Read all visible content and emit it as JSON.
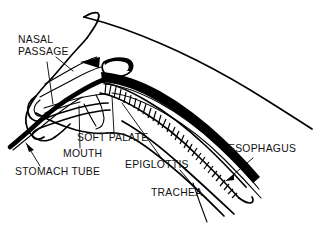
{
  "diagram": {
    "style": "black-and-white line drawing",
    "background_color": "#ffffff",
    "ink_color": "#000000"
  },
  "labels": [
    {
      "id": "nasal-passage",
      "line1": "NASAL",
      "line2": "PASSAGE",
      "x": 18,
      "y": 43,
      "anchor": "start"
    },
    {
      "id": "soft-palate",
      "line1": "SOFT PALATE",
      "line2": "",
      "x": 77,
      "y": 141,
      "anchor": "start"
    },
    {
      "id": "mouth",
      "line1": "MOUTH",
      "line2": "",
      "x": 63,
      "y": 157,
      "anchor": "start"
    },
    {
      "id": "stomach-tube",
      "line1": "STOMACH TUBE",
      "line2": "",
      "x": 15,
      "y": 175,
      "anchor": "start"
    },
    {
      "id": "epiglottis",
      "line1": "EPIGLOTTIS",
      "line2": "",
      "x": 125,
      "y": 168,
      "anchor": "start"
    },
    {
      "id": "trachea",
      "line1": "TRACHEA",
      "line2": "",
      "x": 151,
      "y": 196,
      "anchor": "start"
    },
    {
      "id": "esophagus",
      "line1": "ESOPHAGUS",
      "line2": "",
      "x": 228,
      "y": 152,
      "anchor": "start"
    }
  ]
}
